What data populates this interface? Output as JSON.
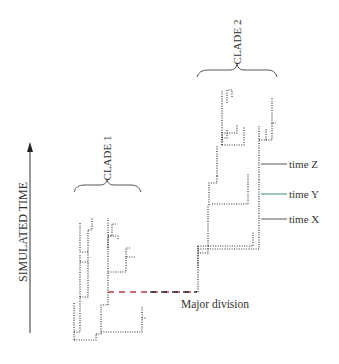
{
  "axis": {
    "label": "SIMULATED TIME",
    "direction": "up"
  },
  "clades": [
    {
      "label": "CLADE 1"
    },
    {
      "label": "CLADE 2"
    }
  ],
  "annotations": {
    "major_division": "Major division",
    "time_z": "time Z",
    "time_y": "time Y",
    "time_x": "time X"
  },
  "colors": {
    "tree": "#333333",
    "major_division_start": "#c0394a",
    "major_division_end": "#333333",
    "time_y_tick": "#2e7d6b",
    "text": "#333333"
  }
}
